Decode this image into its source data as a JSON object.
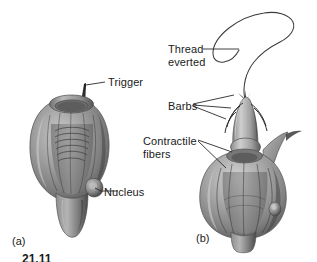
{
  "figure": {
    "width": 317,
    "height": 262,
    "background": "#ffffff",
    "caption_partial": "21.11"
  },
  "panels": [
    {
      "tag": "(a)",
      "state": "undischarged",
      "labels": [
        {
          "id": "trigger",
          "text": "Trigger"
        },
        {
          "id": "nucleus",
          "text": "Nucleus"
        }
      ]
    },
    {
      "tag": "(b)",
      "state": "discharged",
      "labels": [
        {
          "id": "thread",
          "line1": "Thread",
          "line2": "everted"
        },
        {
          "id": "barbs",
          "text": "Barbs"
        },
        {
          "id": "contractile",
          "line1": "Contractile",
          "line2": "fibers"
        }
      ]
    }
  ],
  "labels": {
    "trigger": "Trigger",
    "nucleus": "Nucleus",
    "thread_line1": "Thread",
    "thread_line2": "everted",
    "barbs": "Barbs",
    "contractile_line1": "Contractile",
    "contractile_line2": "fibers",
    "tag_a": "(a)",
    "tag_b": "(b)"
  },
  "colors": {
    "background": "#ffffff",
    "text": "#1a1a1a",
    "leader_line": "#2a2a2a",
    "body_light": "#d6d6d6",
    "body_mid": "#9a9a9a",
    "body_dark": "#5e5e5e",
    "body_shadow": "#3d3d3d",
    "outline": "#4a4a4a"
  }
}
